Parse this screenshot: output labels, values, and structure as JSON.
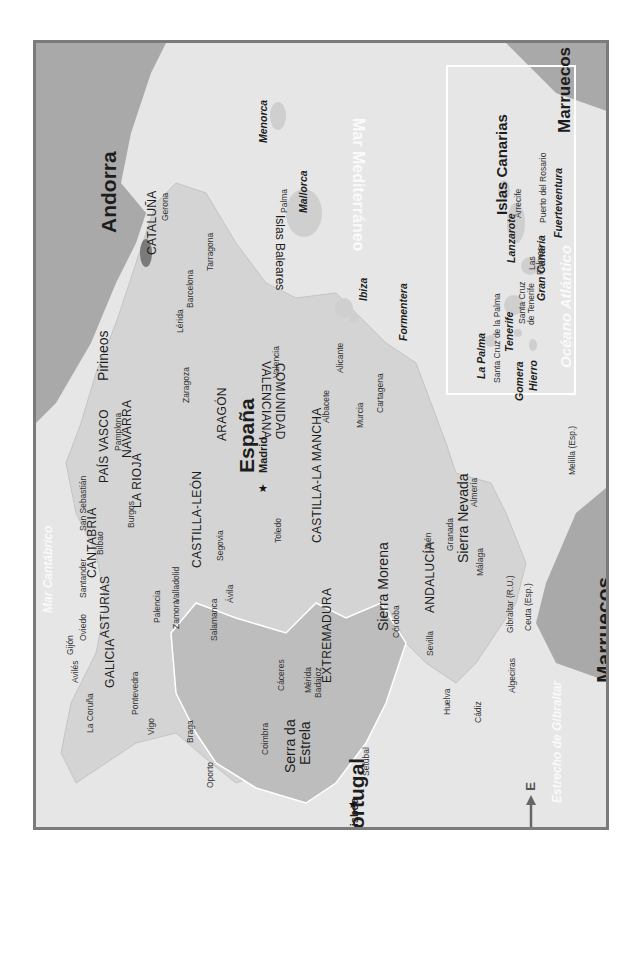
{
  "map": {
    "title": "España",
    "orientation": "rotated 90°, north to the left",
    "colors": {
      "sea": "#e6e6e6",
      "spain_land": "#d9d9d9",
      "portugal_land": "#bdbdbd",
      "neighbor_land": "#a9a9a9",
      "frame": "#7b7b7b",
      "sea_labels": "#fafafa",
      "text": "#1d1d1d"
    },
    "countries": {
      "spain": "España",
      "portugal": "Portugal",
      "andorra": "Andorra",
      "morocco": "Marruecos",
      "morocco_inset": "Marruecos"
    },
    "capitals": {
      "madrid": "Madrid",
      "lisboa": "Lisboa"
    },
    "regions": {
      "galicia": "GALICIA",
      "asturias": "ASTURIAS",
      "cantabria": "CANTABRIA",
      "pais_vasco": "PAÍS VASCO",
      "navarra": "NAVARRA",
      "la_rioja": "LA RIOJA",
      "aragon": "ARAGÓN",
      "cataluna": "CATALUÑA",
      "castilla_leon": "CASTILLA-LEÓN",
      "castilla_la_mancha": "CASTILLA-LA MANCHA",
      "comunidad_valenciana_1": "COMUNIDAD",
      "comunidad_valenciana_2": "VALENCIANA",
      "extremadura": "EXTREMADURA",
      "andalucia": "ANDALUCÍA"
    },
    "cities": {
      "la_coruna": "La Coruña",
      "pontevedra": "Pontevedra",
      "vigo": "Vigo",
      "aviles": "Avilés",
      "gijon": "Gijón",
      "oviedo": "Oviedo",
      "santander": "Santander",
      "bilbao": "Bilbao",
      "san_sebastian": "San Sebastián",
      "pamplona": "Pamplona",
      "burgos": "Burgos",
      "palencia": "Palencia",
      "valladolid": "Valladolid",
      "zamora": "Zamora",
      "salamanca": "Salamanca",
      "avila": "Ávila",
      "segovia": "Segovia",
      "toledo": "Toledo",
      "zaragoza": "Zaragoza",
      "lerida": "Lérida",
      "barcelona": "Barcelona",
      "tarragona": "Tarragona",
      "gerona": "Gerona",
      "valencia": "Valencia",
      "albacete": "Albacete",
      "alicante": "Alicante",
      "murcia": "Murcia",
      "cartagena": "Cartagena",
      "caceres": "Cáceres",
      "merida": "Mérida",
      "badajoz": "Badajoz",
      "huelva": "Huelva",
      "sevilla": "Sevilla",
      "cordoba": "Córdoba",
      "jaen": "Jaén",
      "granada": "Granada",
      "almeria": "Almería",
      "malaga": "Málaga",
      "cadiz": "Cádiz",
      "algeciras": "Algeciras",
      "gibraltar": "Gibraltar (R.U.)",
      "ceuta": "Ceuta (Esp.)",
      "melilla": "Melilla (Esp.)",
      "palma": "Palma",
      "braga": "Braga",
      "oporto": "Oporto",
      "coimbra": "Coimbra",
      "setubal": "Setúbal"
    },
    "mountains": {
      "pirineos": "Pirineos",
      "sierra_morena": "Sierra Morena",
      "sierra_nevada": "Sierra Nevada",
      "serra_estrela_1": "Serra da",
      "serra_estrela_2": "Estrela"
    },
    "waters": {
      "mar_cantabrico": "Mar Cantábrico",
      "mar_mediterraneo": "Mar Mediterráneo",
      "oceano_atlantico": "Océano Atlántico",
      "estrecho_gibraltar": "Estrecho de Gibraltar",
      "oceano_atlantico_inset": "Océano Atlántico"
    },
    "balearic": {
      "group": "Islas Baleares",
      "menorca": "Menorca",
      "mallorca": "Mallorca",
      "ibiza": "Ibiza",
      "formentera": "Formentera"
    },
    "canarias_inset": {
      "title": "Islas Canarias",
      "la_palma": "La Palma",
      "santa_cruz_palma": "Santa Cruz de la Palma",
      "tenerife": "Tenerife",
      "santa_cruz_tenerife_1": "Santa Cruz",
      "santa_cruz_tenerife_2": "de Tenerife",
      "gomera": "Gomera",
      "hierro": "Hierro",
      "gran_canaria": "Gran Canaria",
      "las_palmas_1": "Las",
      "las_palmas_2": "Palmas",
      "lanzarote": "Lanzarote",
      "arrecife": "Arrecife",
      "fuerteventura": "Fuerteventura",
      "puerto_rosario": "Puerto del Rosario"
    },
    "compass": {
      "north": "N",
      "south": "S",
      "east": "E",
      "west": "O"
    }
  }
}
